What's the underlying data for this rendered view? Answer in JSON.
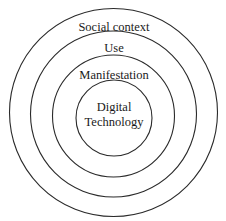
{
  "diagram": {
    "type": "concentric-circles",
    "layers": [
      {
        "name": "social-context",
        "label": "Social context",
        "radius": 104
      },
      {
        "name": "use",
        "label": "Use",
        "radius": 83
      },
      {
        "name": "manifestation",
        "label": "Manifestation",
        "radius": 61
      },
      {
        "name": "digital-technology",
        "label_line1": "Digital",
        "label_line2": "Technology",
        "radius": 38
      }
    ],
    "colors": {
      "stroke": "#2a2a2a",
      "text": "#1a1a1a",
      "background": "#ffffff"
    }
  }
}
